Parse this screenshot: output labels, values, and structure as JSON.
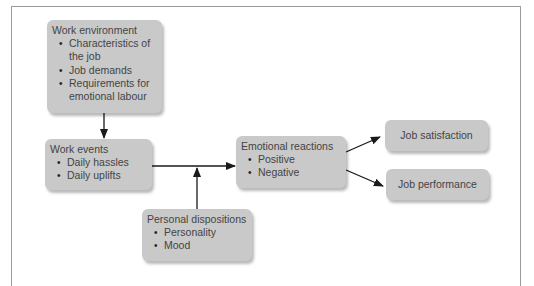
{
  "diagram": {
    "nodes": {
      "work_environment": {
        "title": "Work environment",
        "items": [
          "Characteristics of the job",
          "Job demands",
          "Requirements for emotional labour"
        ],
        "item_lines": [
          "Characteristics of",
          "the job"
        ],
        "item_lines_3": [
          "Requirements for",
          "emotional labour"
        ]
      },
      "work_events": {
        "title": "Work events",
        "items": [
          "Daily hassles",
          "Daily uplifts"
        ]
      },
      "personal_dispositions": {
        "title": "Personal dispositions",
        "items": [
          "Personality",
          "Mood"
        ]
      },
      "emotional_reactions": {
        "title": "Emotional reactions",
        "items": [
          "Positive",
          "Negative"
        ]
      },
      "job_satisfaction": {
        "title": "Job satisfaction"
      },
      "job_performance": {
        "title": "Job performance"
      }
    },
    "edges": [
      {
        "from": "Work environment",
        "to": "Work events"
      },
      {
        "from": "Work events",
        "to": "Emotional reactions"
      },
      {
        "from": "Personal dispositions",
        "to": "Work events → Emotional reactions link"
      },
      {
        "from": "Emotional reactions",
        "to": "Job satisfaction"
      },
      {
        "from": "Emotional reactions",
        "to": "Job performance"
      }
    ],
    "colors": {
      "box_fill": "#c9c9c9",
      "text": "#444444",
      "arrow": "#1a1a1a",
      "frame": "#9a9a9a"
    }
  }
}
